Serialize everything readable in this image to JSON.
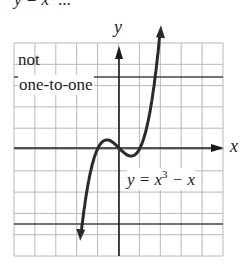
{
  "title_fragment": "y = x³ ...",
  "axes": {
    "x_label": "x",
    "y_label": "y"
  },
  "annotation": {
    "line1": "not",
    "line2": "one-to-one"
  },
  "equation": {
    "lhs": "y = x",
    "exp": "3",
    "rhs": " − x"
  },
  "colors": {
    "grid": "#b8b8b8",
    "axis": "#1a1a1a",
    "curve": "#2a2a2a",
    "hline": "#444444",
    "text": "#222222"
  },
  "chart_data": {
    "type": "line",
    "xlabel": "x",
    "ylabel": "y",
    "xlim": [
      -5,
      5
    ],
    "ylim": [
      -5,
      5
    ],
    "grid": true,
    "series": [
      {
        "name": "y = x^3 - x",
        "function": "x^3 - x",
        "x_range": [
          -1.8,
          1.95
        ]
      }
    ],
    "horizontal_lines": [
      {
        "y": 3.4
      },
      {
        "y": -3.6
      }
    ],
    "annotations": [
      "not one-to-one"
    ]
  }
}
